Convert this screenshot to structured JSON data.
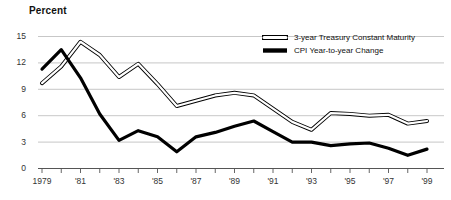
{
  "chart_data": {
    "type": "line",
    "title": "Percent",
    "xlabel": "",
    "ylabel": "Percent",
    "ylim": [
      0,
      15
    ],
    "xlim": [
      1979,
      1999
    ],
    "yticks": [
      0,
      3,
      6,
      9,
      12,
      15
    ],
    "ytick_labels": [
      "0",
      "3",
      "6",
      "9",
      "12",
      "15"
    ],
    "grid": true,
    "grid_axis": "y",
    "legend_position": "top-right-inside",
    "x": [
      1979,
      1980,
      1981,
      1982,
      1983,
      1984,
      1985,
      1986,
      1987,
      1988,
      1989,
      1990,
      1991,
      1992,
      1993,
      1994,
      1995,
      1996,
      1997,
      1998,
      1999
    ],
    "xtick_labels": [
      "1979",
      "",
      "'81",
      "",
      "'83",
      "",
      "'85",
      "",
      "'87",
      "",
      "'89",
      "",
      "'91",
      "",
      "'93",
      "",
      "'95",
      "",
      "'97",
      "",
      "'99"
    ],
    "series": [
      {
        "name": "3-year Treasury Constant Maturity",
        "style": "hollow-outline",
        "color": "#ffffff",
        "edge_color": "#000000",
        "values": [
          9.7,
          11.6,
          14.4,
          12.9,
          10.4,
          11.9,
          9.6,
          7.1,
          7.7,
          8.3,
          8.6,
          8.3,
          6.8,
          5.3,
          4.4,
          6.3,
          6.2,
          6.0,
          6.1,
          5.1,
          5.4
        ]
      },
      {
        "name": "CPI Year-to-year Change",
        "style": "solid-thick",
        "color": "#000000",
        "values": [
          11.3,
          13.5,
          10.3,
          6.2,
          3.2,
          4.3,
          3.6,
          1.9,
          3.6,
          4.1,
          4.8,
          5.4,
          4.2,
          3.0,
          3.0,
          2.6,
          2.8,
          2.9,
          2.3,
          1.5,
          2.2
        ]
      }
    ]
  },
  "legend": {
    "items": [
      {
        "label": "3-year Treasury Constant Maturity",
        "marker": "hollow-line-swatch"
      },
      {
        "label": "CPI Year-to-year Change",
        "marker": "solid-line-swatch"
      }
    ]
  },
  "colors": {
    "background": "#ffffff",
    "gridline": "#b9b9b9",
    "axis": "#555555",
    "text": "#1a1a1a",
    "cpi_line": "#000000",
    "treasury_fill": "#ffffff",
    "treasury_edge": "#000000"
  }
}
